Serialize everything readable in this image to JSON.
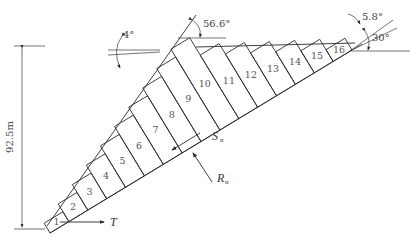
{
  "diagram": {
    "type": "slope stability slice diagram",
    "height_label": "92.5m",
    "angles": {
      "slope_face": "56.6°",
      "crest_tilt": "4°",
      "right_small": "5.8°",
      "failure_plane": "30°"
    },
    "forces": {
      "thrust": "T",
      "shear": "S",
      "shear_sub": "n",
      "reaction": "R",
      "reaction_sub": "n"
    },
    "slice_labels": [
      "1",
      "2",
      "3",
      "4",
      "5",
      "6",
      "7",
      "8",
      "9",
      "10",
      "11",
      "12",
      "13",
      "14",
      "15",
      "16"
    ]
  }
}
